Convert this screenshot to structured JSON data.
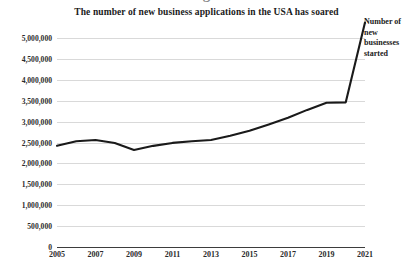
{
  "title": "The number of new business applications in the USA has soared",
  "top_cut_glyph": "g",
  "annotation": {
    "lines": [
      "Number of",
      "new",
      "businesses",
      "started"
    ]
  },
  "colors": {
    "background": "#ffffff",
    "gridline": "#d9d9d9",
    "axis": "#3d3d3d",
    "line": "#1a1a1a",
    "text": "#1a1a1a"
  },
  "chart_data": {
    "type": "line",
    "title": "The number of new business applications in the USA has soared",
    "xlabel": "",
    "ylabel": "",
    "xlim": [
      2005,
      2021
    ],
    "ylim": [
      0,
      5000000
    ],
    "grid": true,
    "legend_position": "right-annotation",
    "xticks": [
      2005,
      2007,
      2009,
      2011,
      2013,
      2015,
      2017,
      2019,
      2021
    ],
    "xtick_labels": [
      "2005",
      "2007",
      "2009",
      "2011",
      "2013",
      "2015",
      "2017",
      "2019",
      "2021"
    ],
    "yticks": [
      0,
      500000,
      1000000,
      1500000,
      2000000,
      2500000,
      3000000,
      3500000,
      4000000,
      4500000,
      5000000
    ],
    "ytick_labels": [
      "0",
      "500,000",
      "1,000,000",
      "1,500,000",
      "2,000,000",
      "2,500,000",
      "3,000,000",
      "3,500,000",
      "4,000,000",
      "4,500,000",
      "5,000,000"
    ],
    "series": [
      {
        "name": "Number of new businesses started",
        "x": [
          2005,
          2006,
          2007,
          2008,
          2009,
          2010,
          2011,
          2012,
          2013,
          2014,
          2015,
          2016,
          2017,
          2018,
          2019,
          2020,
          2021
        ],
        "values": [
          2420000,
          2530000,
          2560000,
          2490000,
          2320000,
          2420000,
          2490000,
          2530000,
          2560000,
          2660000,
          2780000,
          2930000,
          3090000,
          3280000,
          3450000,
          3460000,
          5370000
        ]
      }
    ]
  }
}
